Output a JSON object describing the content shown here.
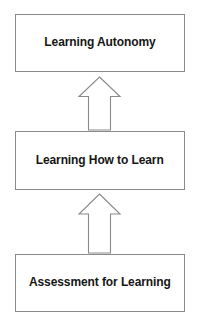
{
  "diagram": {
    "type": "vertical-flow",
    "title": "",
    "direction": "bottom-to-top",
    "background_color": "#ffffff",
    "box_border_color": "#8a8a8a",
    "box_fill_color": "#ffffff",
    "text_color": "#161616",
    "arrow_stroke_color": "#8a8a8a",
    "arrow_fill_color": "#ffffff",
    "steps": [
      {
        "label": "Learning Autonomy",
        "position": "top"
      },
      {
        "label": "Learning How to Learn",
        "position": "middle"
      },
      {
        "label": "Assessment for Learning",
        "position": "bottom"
      }
    ],
    "connectors": [
      {
        "icon": "arrow-up-icon",
        "from": "Learning How to Learn",
        "to": "Learning Autonomy"
      },
      {
        "icon": "arrow-up-icon",
        "from": "Assessment for Learning",
        "to": "Learning How to Learn"
      }
    ]
  }
}
